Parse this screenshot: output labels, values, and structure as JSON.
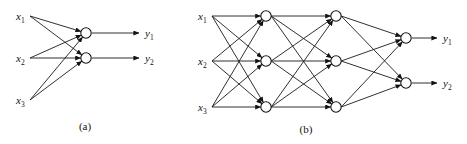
{
  "figure": {
    "background_color": "#ffffff",
    "stroke_color": "#141414",
    "width": 467,
    "height": 144
  },
  "panels": [
    {
      "id": "a",
      "caption": "(a)",
      "caption_x": 85,
      "caption_y": 130,
      "description": "single-layer network: three inputs fully connected to two output units",
      "layers": [
        {
          "name": "input-layer",
          "type": "input",
          "x": 30,
          "nodes": [
            {
              "label": "x",
              "subscript": "1",
              "y": 16,
              "label_x": 16,
              "has_circle": false
            },
            {
              "label": "x",
              "subscript": "2",
              "y": 58,
              "label_x": 16,
              "has_circle": false
            },
            {
              "label": "x",
              "subscript": "3",
              "y": 100,
              "label_x": 16,
              "has_circle": false
            }
          ]
        },
        {
          "name": "output-layer",
          "type": "output",
          "x": 86,
          "nodes": [
            {
              "label": "",
              "subscript": "",
              "y": 33,
              "has_circle": true
            },
            {
              "label": "",
              "subscript": "",
              "y": 58,
              "has_circle": true
            }
          ]
        }
      ],
      "outputs": [
        {
          "label": "y",
          "subscript": "1",
          "y": 33,
          "arrow_from_x": 92,
          "arrow_to_x": 139,
          "label_x": 145
        },
        {
          "label": "y",
          "subscript": "2",
          "y": 58,
          "arrow_from_x": 92,
          "arrow_to_x": 139,
          "label_x": 145
        }
      ],
      "connections": [
        {
          "from_layer": 0,
          "from_node": 0,
          "to_layer": 1,
          "to_node": 0
        },
        {
          "from_layer": 0,
          "from_node": 0,
          "to_layer": 1,
          "to_node": 1
        },
        {
          "from_layer": 0,
          "from_node": 1,
          "to_layer": 1,
          "to_node": 0
        },
        {
          "from_layer": 0,
          "from_node": 1,
          "to_layer": 1,
          "to_node": 1
        },
        {
          "from_layer": 0,
          "from_node": 2,
          "to_layer": 1,
          "to_node": 0
        },
        {
          "from_layer": 0,
          "from_node": 2,
          "to_layer": 1,
          "to_node": 1
        }
      ]
    },
    {
      "id": "b",
      "caption": "(b)",
      "caption_x": 306,
      "caption_y": 133,
      "description": "multilayer network: three inputs, two hidden layers of three units each, two output units",
      "layers": [
        {
          "name": "input-layer",
          "type": "input",
          "x": 212,
          "nodes": [
            {
              "label": "x",
              "subscript": "1",
              "y": 16,
              "label_x": 198,
              "has_circle": false
            },
            {
              "label": "x",
              "subscript": "2",
              "y": 61,
              "label_x": 198,
              "has_circle": false
            },
            {
              "label": "x",
              "subscript": "3",
              "y": 107,
              "label_x": 198,
              "has_circle": false
            }
          ]
        },
        {
          "name": "hidden-layer-1",
          "type": "hidden",
          "x": 266,
          "nodes": [
            {
              "label": "",
              "subscript": "",
              "y": 16,
              "has_circle": true
            },
            {
              "label": "",
              "subscript": "",
              "y": 61,
              "has_circle": true
            },
            {
              "label": "",
              "subscript": "",
              "y": 107,
              "has_circle": true
            }
          ]
        },
        {
          "name": "hidden-layer-2",
          "type": "hidden",
          "x": 336,
          "nodes": [
            {
              "label": "",
              "subscript": "",
              "y": 16,
              "has_circle": true
            },
            {
              "label": "",
              "subscript": "",
              "y": 61,
              "has_circle": true
            },
            {
              "label": "",
              "subscript": "",
              "y": 107,
              "has_circle": true
            }
          ]
        },
        {
          "name": "output-layer",
          "type": "output",
          "x": 406,
          "nodes": [
            {
              "label": "",
              "subscript": "",
              "y": 38,
              "has_circle": true
            },
            {
              "label": "",
              "subscript": "",
              "y": 83,
              "has_circle": true
            }
          ]
        }
      ],
      "outputs": [
        {
          "label": "y",
          "subscript": "1",
          "y": 38,
          "arrow_from_x": 412,
          "arrow_to_x": 437,
          "label_x": 443
        },
        {
          "label": "y",
          "subscript": "2",
          "y": 83,
          "arrow_from_x": 412,
          "arrow_to_x": 437,
          "label_x": 443
        }
      ],
      "connections": [
        {
          "from_layer": 0,
          "from_node": 0,
          "to_layer": 1,
          "to_node": 0
        },
        {
          "from_layer": 0,
          "from_node": 0,
          "to_layer": 1,
          "to_node": 1
        },
        {
          "from_layer": 0,
          "from_node": 0,
          "to_layer": 1,
          "to_node": 2
        },
        {
          "from_layer": 0,
          "from_node": 1,
          "to_layer": 1,
          "to_node": 0
        },
        {
          "from_layer": 0,
          "from_node": 1,
          "to_layer": 1,
          "to_node": 1
        },
        {
          "from_layer": 0,
          "from_node": 1,
          "to_layer": 1,
          "to_node": 2
        },
        {
          "from_layer": 0,
          "from_node": 2,
          "to_layer": 1,
          "to_node": 0
        },
        {
          "from_layer": 0,
          "from_node": 2,
          "to_layer": 1,
          "to_node": 1
        },
        {
          "from_layer": 0,
          "from_node": 2,
          "to_layer": 1,
          "to_node": 2
        },
        {
          "from_layer": 1,
          "from_node": 0,
          "to_layer": 2,
          "to_node": 0
        },
        {
          "from_layer": 1,
          "from_node": 0,
          "to_layer": 2,
          "to_node": 1
        },
        {
          "from_layer": 1,
          "from_node": 0,
          "to_layer": 2,
          "to_node": 2
        },
        {
          "from_layer": 1,
          "from_node": 1,
          "to_layer": 2,
          "to_node": 0
        },
        {
          "from_layer": 1,
          "from_node": 1,
          "to_layer": 2,
          "to_node": 1
        },
        {
          "from_layer": 1,
          "from_node": 1,
          "to_layer": 2,
          "to_node": 2
        },
        {
          "from_layer": 1,
          "from_node": 2,
          "to_layer": 2,
          "to_node": 0
        },
        {
          "from_layer": 1,
          "from_node": 2,
          "to_layer": 2,
          "to_node": 1
        },
        {
          "from_layer": 1,
          "from_node": 2,
          "to_layer": 2,
          "to_node": 2
        },
        {
          "from_layer": 2,
          "from_node": 0,
          "to_layer": 3,
          "to_node": 0
        },
        {
          "from_layer": 2,
          "from_node": 0,
          "to_layer": 3,
          "to_node": 1
        },
        {
          "from_layer": 2,
          "from_node": 1,
          "to_layer": 3,
          "to_node": 0
        },
        {
          "from_layer": 2,
          "from_node": 1,
          "to_layer": 3,
          "to_node": 1
        },
        {
          "from_layer": 2,
          "from_node": 2,
          "to_layer": 3,
          "to_node": 0
        },
        {
          "from_layer": 2,
          "from_node": 2,
          "to_layer": 3,
          "to_node": 1
        }
      ]
    }
  ]
}
